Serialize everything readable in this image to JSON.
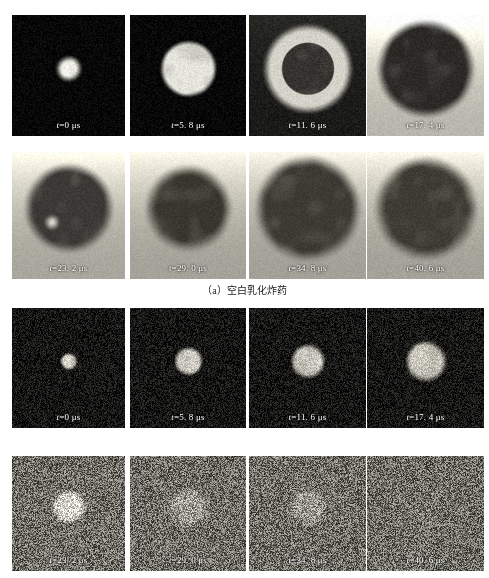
{
  "figure": {
    "kind": "high-speed-framing-sequence",
    "rows": 4,
    "columns": 4,
    "frame_interval_us": 5.8,
    "time_unit": "μs",
    "time_symbol": "t"
  },
  "groups": [
    {
      "id": "a",
      "caption": "（a）空白乳化炸药",
      "frames": [
        {
          "index": 0,
          "time_value": "0",
          "label_prefix": "t",
          "label_eq": "=",
          "label_value": "0",
          "label_unit": "μs",
          "label": "t=0 μs",
          "appearance": "small bright core on black field",
          "bg": "#070707",
          "core": "#f2f2ea",
          "core_r": 0.055,
          "glow_r": 0.13,
          "halo_r": 0.0,
          "ring": false,
          "noise": 0.05,
          "gradient": "none"
        },
        {
          "index": 1,
          "time_value": "5.8",
          "label_prefix": "t",
          "label_eq": "=",
          "label_value": "5. 8",
          "label_unit": "μs",
          "label": "t=5. 8 μs",
          "appearance": "bright mottled disc on black field",
          "bg": "#070707",
          "core": "#e4e4dc",
          "core_r": 0.2,
          "glow_r": 0.255,
          "halo_r": 0.0,
          "ring": false,
          "noise": 0.05,
          "gradient": "none"
        },
        {
          "index": 2,
          "time_value": "11.6",
          "label_prefix": "t",
          "label_eq": "=",
          "label_value": "11. 6",
          "label_unit": "μs",
          "label": "t=11. 6 μs",
          "appearance": "bright annulus with dark core, dark outer field",
          "bg": "#1a1a18",
          "core": "#35332f",
          "core_r": 0.215,
          "glow_r": 0.23,
          "halo_r": 0.4,
          "ring": true,
          "ring_color": "#d5d3c9",
          "noise": 0.045,
          "gradient": "top-bright"
        },
        {
          "index": 3,
          "time_value": "17.4",
          "label_prefix": "t",
          "label_eq": "=",
          "label_value": "17. 4",
          "label_unit": "μs",
          "label": "t=17. 4 μs",
          "appearance": "large dark cloud on light grey background",
          "bg": "#b9b7ad",
          "core": "#2a2926",
          "core_r": 0.33,
          "glow_r": 0.44,
          "halo_r": 0.0,
          "ring": false,
          "noise": 0.035,
          "gradient": "top-bright"
        }
      ],
      "frames_row2": [
        {
          "index": 4,
          "time_value": "23.2",
          "label_prefix": "t",
          "label_eq": "=",
          "label_value": "23. 2",
          "label_unit": "μs",
          "label": "t=23. 2 μs",
          "appearance": "dark plume, light pocket lower-left of core, grey field",
          "bg": "#a9a79d",
          "core": "#3a3935",
          "core_r": 0.3,
          "glow_r": 0.42,
          "halo_r": 0.0,
          "ring": false,
          "noise": 0.03,
          "gradient": "top-bright",
          "bright_spot": {
            "x": 0.35,
            "y": 0.55,
            "r": 0.085,
            "color": "#e6e4da"
          }
        },
        {
          "index": 5,
          "time_value": "29.0",
          "label_prefix": "t",
          "label_eq": "=",
          "label_value": "29. 0",
          "label_unit": "μs",
          "label": "t=29. 0 μs",
          "appearance": "vertical dark plume on grey field",
          "bg": "#a5a399",
          "core": "#38372f",
          "core_r": 0.26,
          "glow_r": 0.4,
          "halo_r": 0.0,
          "ring": false,
          "noise": 0.03,
          "gradient": "top-bright"
        },
        {
          "index": 6,
          "time_value": "34.8",
          "label_prefix": "t",
          "label_eq": "=",
          "label_value": "34. 8",
          "label_unit": "μs",
          "label": "t=34. 8 μs",
          "appearance": "broad dark cloud filling upper frame on grey field",
          "bg": "#a3a197",
          "core": "#3b3a33",
          "core_r": 0.34,
          "glow_r": 0.48,
          "halo_r": 0.0,
          "ring": false,
          "noise": 0.03,
          "gradient": "top-bright"
        },
        {
          "index": 7,
          "time_value": "40.6",
          "label_prefix": "t",
          "label_eq": "=",
          "label_value": "40. 6",
          "label_unit": "μs",
          "label": "t=40. 6 μs",
          "appearance": "irregular dark cloud with ragged right edge on grey field",
          "bg": "#a4a298",
          "core": "#3d3c34",
          "core_r": 0.33,
          "glow_r": 0.47,
          "halo_r": 0.0,
          "ring": false,
          "noise": 0.035,
          "gradient": "top-bright"
        }
      ]
    },
    {
      "id": "b",
      "caption": "",
      "frames": [
        {
          "index": 0,
          "time_value": "0",
          "label_prefix": "t",
          "label_eq": "=",
          "label_value": "0",
          "label_unit": "μs",
          "label": "t=0 μs",
          "appearance": "tiny bright blob on speckled dark field",
          "bg": "#141412",
          "core": "#d8d6cc",
          "core_r": 0.045,
          "glow_r": 0.085,
          "halo_r": 0.0,
          "ring": false,
          "noise": 0.13,
          "gradient": "none"
        },
        {
          "index": 1,
          "time_value": "5.8",
          "label_prefix": "t",
          "label_eq": "=",
          "label_value": "5. 8",
          "label_unit": "μs",
          "label": "t=5. 8 μs",
          "appearance": "small irregular bright cluster on dark field",
          "bg": "#141412",
          "core": "#cfcdc3",
          "core_r": 0.085,
          "glow_r": 0.135,
          "halo_r": 0.0,
          "ring": false,
          "noise": 0.13,
          "gradient": "none"
        },
        {
          "index": 2,
          "time_value": "11.6",
          "label_prefix": "t",
          "label_eq": "=",
          "label_value": "11. 6",
          "label_unit": "μs",
          "label": "t=11. 6 μs",
          "appearance": "growing bright blotch on dark field",
          "bg": "#151513",
          "core": "#cbc9bf",
          "core_r": 0.105,
          "glow_r": 0.16,
          "halo_r": 0.0,
          "ring": false,
          "noise": 0.13,
          "gradient": "none"
        },
        {
          "index": 3,
          "time_value": "17.4",
          "label_prefix": "t",
          "label_eq": "=",
          "label_value": "17. 4",
          "label_unit": "μs",
          "label": "t=17. 4 μs",
          "appearance": "larger diffuse bright blotch on dark field",
          "bg": "#161614",
          "core": "#ccc9bf",
          "core_r": 0.125,
          "glow_r": 0.19,
          "halo_r": 0.0,
          "ring": false,
          "noise": 0.13,
          "gradient": "none"
        }
      ],
      "frames_row2": [
        {
          "index": 4,
          "time_value": "23.2",
          "label_prefix": "t",
          "label_eq": "=",
          "label_value": "23. 2",
          "label_unit": "μs",
          "label": "t=23. 2 μs",
          "appearance": "faint bright patch in heavy grey speckle",
          "bg": "#6e6d66",
          "core": "#d7d5cb",
          "core_r": 0.095,
          "glow_r": 0.165,
          "halo_r": 0.0,
          "ring": false,
          "noise": 0.3,
          "gradient": "none"
        },
        {
          "index": 5,
          "time_value": "29.0",
          "label_prefix": "t",
          "label_eq": "=",
          "label_value": "29. 0",
          "label_unit": "μs",
          "label": "t=29. 0 μs",
          "appearance": "very faint brightening in grey speckle",
          "bg": "#6e6d66",
          "core": "#9e9c93",
          "core_r": 0.11,
          "glow_r": 0.2,
          "halo_r": 0.0,
          "ring": false,
          "noise": 0.3,
          "gradient": "none"
        },
        {
          "index": 6,
          "time_value": "34.8",
          "label_prefix": "t",
          "label_eq": "=",
          "label_value": "34. 8",
          "label_unit": "μs",
          "label": "t=34. 8 μs",
          "appearance": "barely visible brightening in grey speckle",
          "bg": "#6e6d66",
          "core": "#97958c",
          "core_r": 0.1,
          "glow_r": 0.19,
          "halo_r": 0.0,
          "ring": false,
          "noise": 0.3,
          "gradient": "none"
        },
        {
          "index": 7,
          "time_value": "40.6",
          "label_prefix": "t",
          "label_eq": "=",
          "label_value": "40. 6",
          "label_unit": "μs",
          "label": "t=40. 6 μs",
          "appearance": "uniform grey speckle, no discernible core",
          "bg": "#6e6d66",
          "core": "#74736c",
          "core_r": 0.07,
          "glow_r": 0.15,
          "halo_r": 0.0,
          "ring": false,
          "noise": 0.3,
          "gradient": "none"
        }
      ]
    }
  ],
  "layout": {
    "panel_lefts": [
      12,
      130,
      249,
      367
    ],
    "panel_widths": [
      113,
      116,
      117,
      117
    ],
    "row_tops": [
      15,
      152,
      308,
      456
    ],
    "row_heights": [
      121,
      127,
      120,
      115
    ]
  },
  "colors": {
    "page_background": "#ffffff",
    "label_text": "#ffffff",
    "caption_text": "#1b1b1b"
  }
}
